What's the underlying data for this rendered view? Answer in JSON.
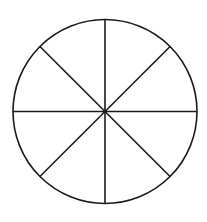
{
  "diagram": {
    "type": "divided-circle",
    "sectors": 8,
    "center": {
      "x": 105,
      "y": 111.5
    },
    "radius": 92,
    "stroke_color": "#1a1a1a",
    "background_color": "#ffffff",
    "stroke_width": 1.6,
    "divider_angles_deg": [
      0,
      45,
      90,
      135
    ]
  }
}
